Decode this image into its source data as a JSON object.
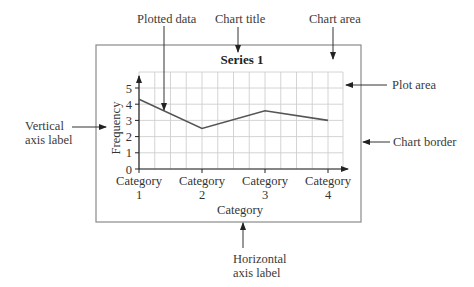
{
  "annotations": {
    "plotted_data": "Plotted data",
    "chart_title": "Chart title",
    "chart_area": "Chart area",
    "plot_area": "Plot area",
    "vertical_axis_label_1": "Vertical",
    "vertical_axis_label_2": "axis label",
    "chart_border": "Chart border",
    "horizontal_axis_label_1": "Horizontal",
    "horizontal_axis_label_2": "axis label"
  },
  "chart": {
    "title": "Series 1",
    "ylabel": "Frequency",
    "xlabel": "Category",
    "yticks": [
      "0",
      "1",
      "2",
      "3",
      "4",
      "5"
    ],
    "xticks": [
      {
        "line1": "Category",
        "line2": "1"
      },
      {
        "line1": "Category",
        "line2": "2"
      },
      {
        "line1": "Category",
        "line2": "3"
      },
      {
        "line1": "Category",
        "line2": "4"
      }
    ]
  },
  "colors": {
    "line": "#555555",
    "grid": "#c8c8c8",
    "border": "#8a8a8a",
    "text": "#333333"
  },
  "chart_data": {
    "type": "line",
    "title": "Series 1",
    "xlabel": "Category",
    "ylabel": "Frequency",
    "categories": [
      "Category 1",
      "Category 2",
      "Category 3",
      "Category 4"
    ],
    "series": [
      {
        "name": "Series 1",
        "values": [
          4.3,
          2.5,
          3.6,
          3.0
        ]
      }
    ],
    "ylim": [
      0,
      5
    ],
    "grid": true,
    "legend": "none"
  }
}
